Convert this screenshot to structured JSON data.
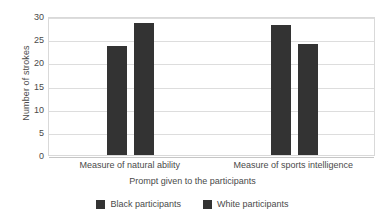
{
  "chart_data": {
    "type": "bar",
    "title": "",
    "subtitle": "",
    "xlabel": "Prompt given to the participants",
    "ylabel": "Number of strokes",
    "categories": [
      "Measure of natural ability",
      "Measure of sports intelligence"
    ],
    "series": [
      {
        "name": "Black participants",
        "values": [
          23.5,
          28.0
        ],
        "color": "#333333"
      },
      {
        "name": "White participants",
        "values": [
          28.5,
          24.0
        ],
        "color": "#333333"
      }
    ],
    "ylim": [
      0,
      30
    ],
    "yticks": [
      0,
      5,
      10,
      15,
      20,
      25,
      30
    ],
    "ytick_labels": [
      "0",
      "5",
      "10",
      "15",
      "20",
      "25",
      "30"
    ],
    "grid": "horizontal",
    "legend_position": "bottom-center",
    "plot_border": true,
    "background_color": "#ffffff",
    "axis_text_color": "#4a4a4a",
    "gridline_color": "#dddddd"
  }
}
